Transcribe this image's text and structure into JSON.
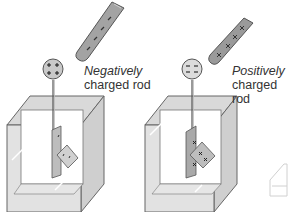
{
  "diagram": {
    "left": {
      "rod_label_line1": "Negatively",
      "rod_label_line2": "charged rod",
      "rod_charge": "negative",
      "bulb_charge": "positive",
      "leaves_charge": "negative"
    },
    "right": {
      "rod_label_line1": "Positively",
      "rod_label_line2": "charged rod",
      "rod_charge": "positive",
      "bulb_charge": "negative",
      "leaves_charge": "positive"
    },
    "colors": {
      "rod_fill": "#9a9a9a",
      "rod_stroke": "#555555",
      "box_fill": "#e4e4e4",
      "box_stroke": "#666666",
      "leaf_fill": "#b8b8b8",
      "text": "#333333"
    }
  }
}
